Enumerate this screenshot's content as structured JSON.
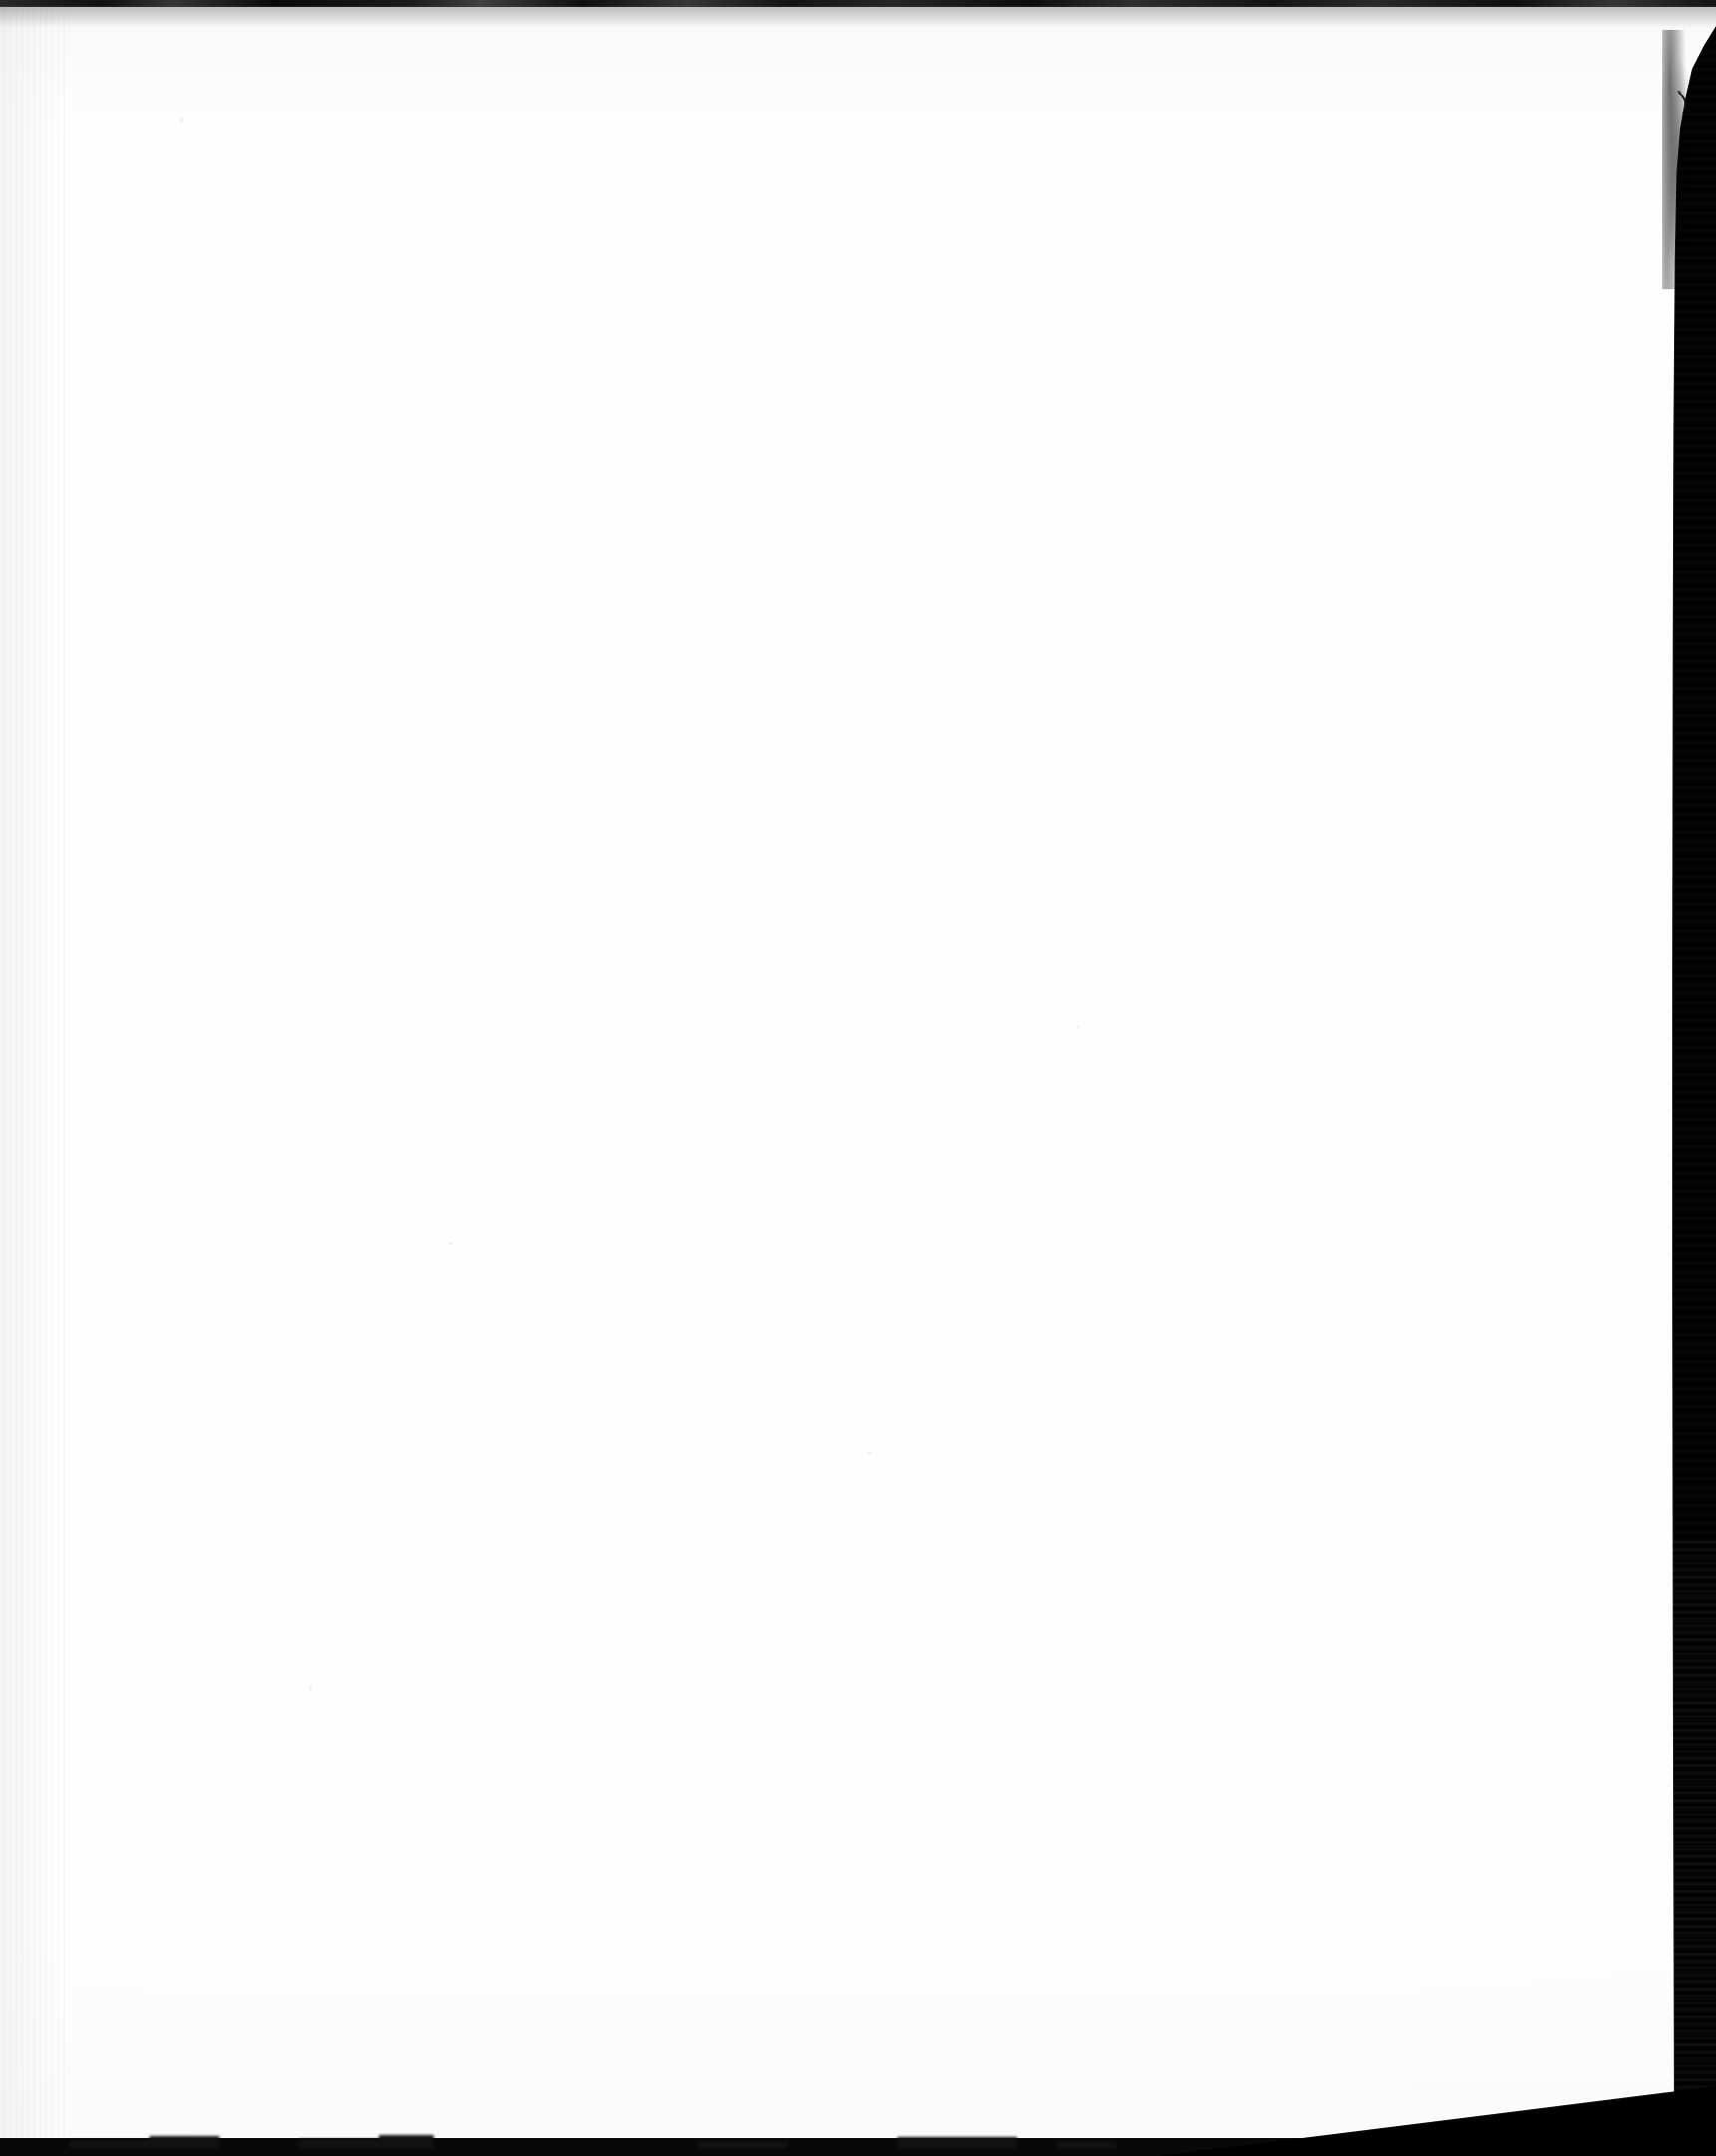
{
  "document": {
    "kind": "scanned-page",
    "content_state": "blank",
    "visible_text": "",
    "page_label": "",
    "caption": "Blank scanned page"
  },
  "canvas": {
    "width_px": 1721,
    "height_px": 2162
  },
  "colors": {
    "paper": "#fefefe",
    "paper_shadow": "#ececee",
    "scanner_background": "#020202",
    "edge_band": "#0a0a0a",
    "ink_mark": "#1a1a1a"
  },
  "regions": {
    "paper": {
      "name": "paper-sheet",
      "description": "Near-white blank sheet occupying most of the frame"
    },
    "top_edge": {
      "name": "top-edge-band",
      "description": "Thin dark strip along the very top of the scan"
    },
    "right_edge": {
      "name": "right-torn-edge",
      "description": "Dark scanner background along the right, torn edge tapering inward"
    },
    "bottom_edge": {
      "name": "bottom-edge-band",
      "description": "Dark band along the bottom with small irregular bumps"
    },
    "corner_wedge": {
      "name": "bottom-right-corner-wedge",
      "description": "Diagonal black wedge cutting the bottom-right corner"
    }
  },
  "artifacts": {
    "ink_mark": {
      "name": "stray-ink-mark",
      "glyph": ")",
      "x_px": 1687,
      "y_px": 102,
      "description": "Small hand-drawn pen stroke near the upper right torn edge"
    },
    "specks": [
      {
        "x_px": 180,
        "y_px": 118
      },
      {
        "x_px": 450,
        "y_px": 1245
      },
      {
        "x_px": 1080,
        "y_px": 1028
      },
      {
        "x_px": 310,
        "y_px": 1690
      },
      {
        "x_px": 870,
        "y_px": 1455
      }
    ]
  }
}
